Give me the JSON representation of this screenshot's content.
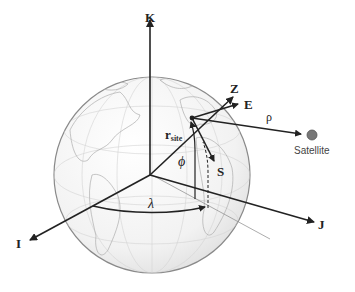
{
  "diagram": {
    "type": "topocentric-horizon coordinate frame on globe",
    "axes": {
      "inertial": {
        "K": "K",
        "I": "I",
        "J": "J"
      },
      "topocentric": {
        "Z": "Z",
        "E": "E",
        "S": "S"
      }
    },
    "labels": {
      "r_site_main": "r",
      "r_site_sub": "site",
      "phi": "ϕ",
      "lambda": "λ",
      "rho": "ρ",
      "satellite": "Satellite"
    },
    "colors": {
      "axis": "#222222",
      "globe_fill": "#f4f4f4",
      "globe_edge": "#888888",
      "coastline": "#b5b5b5",
      "satellite": "#777777"
    }
  }
}
